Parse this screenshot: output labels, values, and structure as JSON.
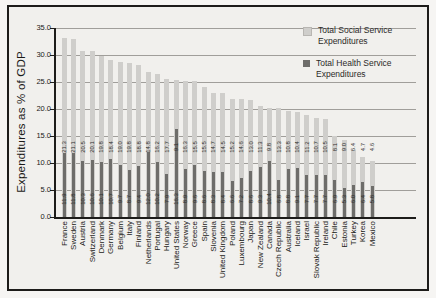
{
  "figure": {
    "ylabel": "Expenditures as % of GDP",
    "legend": [
      {
        "line1": "Total Social Service",
        "line2": "Expenditures",
        "swatch": "#cfcecb"
      },
      {
        "line1": "Total Health Service",
        "line2": "Expenditures",
        "swatch": "#6e6d6a"
      }
    ]
  },
  "chart_data": {
    "type": "bar",
    "title": "",
    "xlabel": "",
    "ylabel": "Expenditures as % of GDP",
    "ylim": [
      0,
      35
    ],
    "y_ticks": [
      "0.0",
      "5.0",
      "10.0",
      "15.0",
      "20.0",
      "25.0",
      "30.0",
      "35.0"
    ],
    "grid": true,
    "legend_position": "top-right inside plot area",
    "bar_style": "Wide light-gray bar = total of social + health (stacked from zero); narrow dark-gray overlay bar = health only. Each bar carries two rotated value labels: upper = social value, lower = health value.",
    "colors": {
      "light_bar": "#cfcecb",
      "dark_bar": "#6e6d6a",
      "gridline": "#a09e9a",
      "axis": "#1d1c1a",
      "label_text": "#2f2e2c"
    },
    "categories": [
      "France",
      "Sweden",
      "Austria",
      "Switzerland",
      "Denmark",
      "Germany",
      "Belgium",
      "Italy",
      "Finland",
      "Netherlands",
      "Portugal",
      "Hungary",
      "United States",
      "Norway",
      "Greece",
      "Spain",
      "Slovenia",
      "United Kingdom",
      "Poland",
      "Luxembourg",
      "Japan",
      "New Zealand",
      "Canada",
      "Czech Republic",
      "Australia",
      "Iceland",
      "Israel",
      "Slovak Republic",
      "Ireland",
      "Chile",
      "Estonia",
      "Turkey",
      "Korea",
      "Mexico"
    ],
    "series": [
      {
        "name": "Total Social Service Expenditures",
        "color": "#cfcecb",
        "values": [
          21.3,
          21.1,
          20.5,
          20.1,
          19.8,
          18.4,
          19.0,
          19.8,
          18.8,
          14.8,
          16.2,
          17.7,
          9.1,
          16.3,
          15.5,
          15.5,
          14.7,
          14.5,
          15.2,
          14.6,
          13.0,
          11.3,
          9.8,
          13.3,
          10.8,
          10.4,
          11.2,
          10.7,
          10.5,
          8.1,
          9.0,
          6.4,
          4.7,
          4.6
        ]
      },
      {
        "name": "Total Health Service Expenditures",
        "color": "#6e6d6a",
        "values": [
          11.9,
          11.8,
          10.3,
          10.6,
          10.1,
          10.7,
          9.7,
          8.7,
          9.4,
          12.0,
          10.2,
          7.9,
          16.3,
          8.9,
          9.6,
          8.6,
          8.3,
          8.4,
          6.6,
          7.2,
          8.6,
          9.3,
          10.4,
          6.8,
          8.8,
          9.1,
          7.7,
          7.7,
          7.7,
          6.9,
          5.3,
          6.0,
          6.4,
          5.8
        ]
      }
    ]
  }
}
